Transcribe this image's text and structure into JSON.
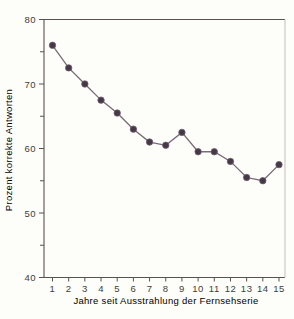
{
  "chart_data": {
    "type": "line",
    "title": "",
    "xlabel": "Jahre seit Ausstrahlung der Fernsehserie",
    "ylabel": "Prozent korrekte Antworten",
    "x": [
      1,
      2,
      3,
      4,
      5,
      6,
      7,
      8,
      9,
      10,
      11,
      12,
      13,
      14,
      15
    ],
    "values": [
      76,
      72.5,
      70,
      67.5,
      65.5,
      63,
      61,
      60.5,
      62.5,
      59.5,
      59.5,
      58,
      55.5,
      55,
      57.5
    ],
    "series_name": "Prozent korrekte Antworten",
    "xticks": [
      1,
      2,
      3,
      4,
      5,
      6,
      7,
      8,
      9,
      10,
      11,
      12,
      13,
      14,
      15
    ],
    "yticks_major": [
      40,
      50,
      60,
      70,
      80
    ],
    "yticks_minor": [
      45,
      55,
      65,
      75
    ],
    "xlim": [
      0.5,
      15.4
    ],
    "ylim": [
      40,
      80
    ],
    "grid": false,
    "legend": "none",
    "marker": "filled-circle",
    "colors": {
      "background": "#fdfdfa",
      "line": "#786b77",
      "marker_fill": "#453947",
      "marker_edge": "#6e616c",
      "axis": "#56524f",
      "axis_right": "#cbcac4",
      "text": "#403e3b"
    }
  }
}
